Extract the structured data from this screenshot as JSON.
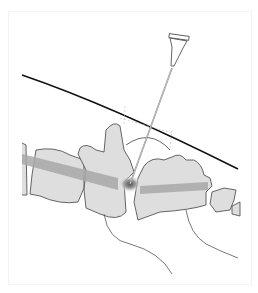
{
  "figure": {
    "colors": {
      "bone_fill": "#dedede",
      "outline": "#555555",
      "skin_line": "#111111",
      "disc_band": "#a8a8a8",
      "needle": "#bdbdbd"
    }
  }
}
